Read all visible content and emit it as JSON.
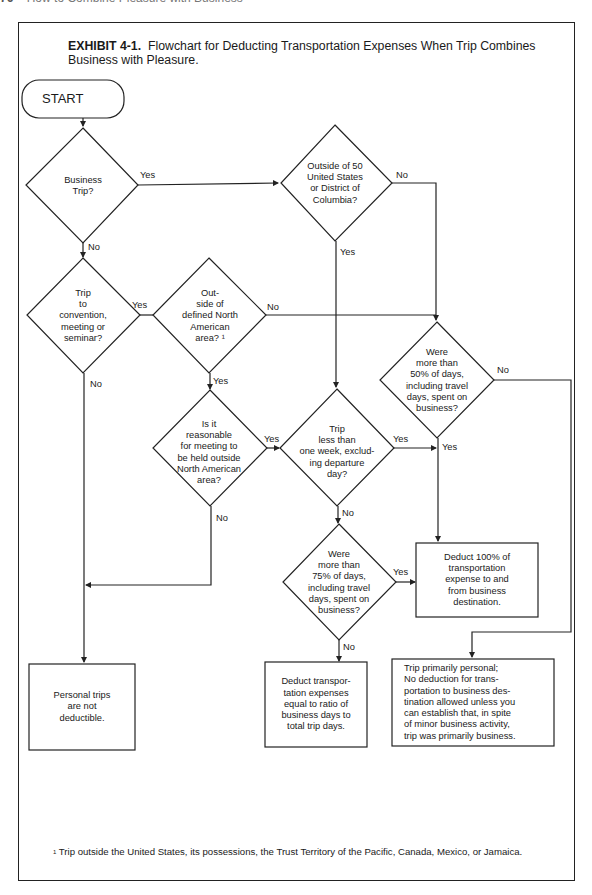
{
  "page_header": {
    "page_number": "76",
    "running_title": "How to Combine Pleasure with Business"
  },
  "exhibit": {
    "label": "EXHIBIT 4-1.",
    "title": "Flowchart for Deducting Transportation Expenses When Trip Combines Business with Pleasure."
  },
  "flowchart": {
    "start": "START",
    "decisions": {
      "business_trip": "Business\nTrip?",
      "outside_50_states": "Outside of 50\nUnited States\nor District of\nColumbia?",
      "convention": "Trip\nto\nconvention,\nmeeting or\nseminar?",
      "outside_north_america": "Out-\nside of\ndefined North\nAmerican\narea? ¹",
      "more_than_50pct": "Were\nmore than\n50% of days,\nincluding travel\ndays, spent on\nbusiness?",
      "reasonable_outside": "Is it\nreasonable\nfor meeting to\nbe held outside\nNorth American\narea?",
      "less_than_week": "Trip\nless than\none week, exclud-\ning departure\nday?",
      "more_than_75pct": "Were\nmore than\n75% of days,\nincluding travel\ndays, spent on\nbusiness?"
    },
    "outcomes": {
      "deduct_100": "Deduct 100% of\ntransportation\nexpense to and\nfrom business\ndestination.",
      "personal_not_deductible": "Personal trips\nare not\ndeductible.",
      "deduct_ratio": "Deduct transpor-\ntation expenses\nequal to ratio of\nbusiness days to\ntotal trip days.",
      "primarily_personal": "Trip primarily personal;\nNo deduction for trans-\nportation to business des-\ntination allowed unless you\ncan establish that, in spite\nof minor business activity,\ntrip was primarily business."
    },
    "edge_labels": {
      "yes": "Yes",
      "no": "No"
    }
  },
  "footnote": {
    "marker": "1",
    "text": "Trip outside the United States, its possessions, the Trust Territory of the Pacific, Canada, Mexico, or Jamaica."
  }
}
